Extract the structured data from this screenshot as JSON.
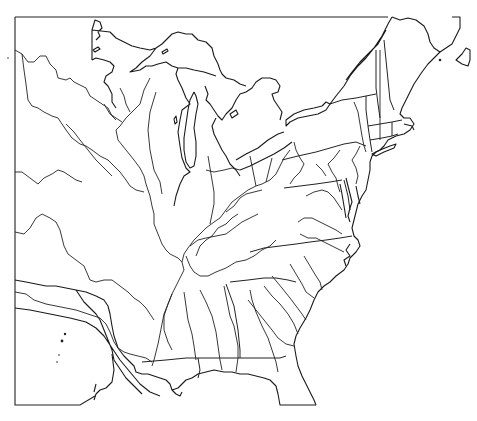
{
  "map": {
    "title": "",
    "region": "Eastern United States",
    "style": "blank outline map",
    "features": {
      "coastline": true,
      "great_lakes": [
        "Lake Superior",
        "Lake Michigan",
        "Lake Huron",
        "Lake Erie",
        "Lake Ontario"
      ],
      "rivers": [
        "Mississippi",
        "Ohio",
        "Tennessee",
        "Missouri",
        "Arkansas",
        "Red",
        "Illinois",
        "Wisconsin",
        "Cumberland",
        "Alabama",
        "Tombigbee",
        "Chattahoochee",
        "Savannah",
        "Santee",
        "Potomac",
        "Susquehanna",
        "Hudson",
        "Connecticut",
        "James",
        "Roanoke"
      ],
      "state_boundaries": true,
      "labels": []
    },
    "colors": {
      "ink": "#222222",
      "background": "#ffffff"
    }
  }
}
